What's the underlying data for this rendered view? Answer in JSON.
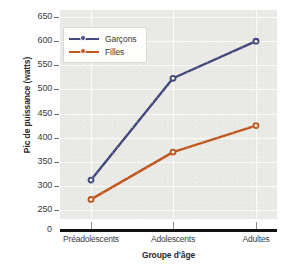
{
  "chart_data": {
    "type": "line",
    "title": "",
    "xlabel": "Groupe d'âge",
    "ylabel": "Pic de puissance (watts)",
    "categories": [
      "Préadolescents",
      "Adolescents",
      "Adultes"
    ],
    "series": [
      {
        "name": "Garçons",
        "color": "#42497b",
        "values": [
          312,
          523,
          600
        ]
      },
      {
        "name": "Filles",
        "color": "#c0571f",
        "values": [
          272,
          370,
          425
        ]
      }
    ],
    "ylim": [
      250,
      650
    ],
    "ytick_labels": [
      "650",
      "600",
      "550",
      "500",
      "450",
      "400",
      "350",
      "300",
      "250"
    ],
    "ytick_values": [
      650,
      600,
      550,
      500,
      450,
      400,
      350,
      300,
      250
    ],
    "axis_origin_label": "0",
    "axis_break": true,
    "grid": true,
    "legend_position": "top-left",
    "plot_background": "#e9e9e6",
    "gridline_color": "#fbfbfa",
    "axis_line_color": "#121212"
  },
  "legend": {
    "entries": [
      {
        "label": "Garçons",
        "color": "#42497b"
      },
      {
        "label": "Filles",
        "color": "#c0571f"
      }
    ]
  }
}
